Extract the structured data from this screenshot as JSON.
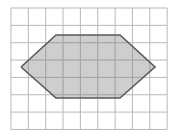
{
  "figure": {
    "background_color": "#ffffff",
    "canvas": {
      "width": 176,
      "height": 134
    }
  },
  "grid": {
    "name": "square-grid",
    "origin_x": 11,
    "origin_y": 8,
    "cell_size": 17.35,
    "columns": 9,
    "rows": 7,
    "line_color": "#b9b9b9",
    "line_width": 1,
    "overlay_line_color": "#a3a3a3"
  },
  "shape": {
    "name": "hexagon",
    "sides": 6,
    "fill_color": "#c6c6c6",
    "fill_opacity": 0.85,
    "stroke_color": "#5a5a5a",
    "stroke_width": 1.6,
    "points_px": "21,67 56,35 120,35 155,67 120,98 56,98",
    "vertices_px": [
      {
        "label": "left",
        "x": 21,
        "y": 67
      },
      {
        "label": "top-left",
        "x": 56,
        "y": 35
      },
      {
        "label": "top-right",
        "x": 120,
        "y": 35
      },
      {
        "label": "right",
        "x": 155,
        "y": 67
      },
      {
        "label": "bottom-right",
        "x": 120,
        "y": 98
      },
      {
        "label": "bottom-left",
        "x": 56,
        "y": 98
      }
    ],
    "vertices_grid": [
      {
        "label": "left",
        "col": 0.58,
        "row": 3.4
      },
      {
        "label": "top-left",
        "col": 2.59,
        "row": 1.56
      },
      {
        "label": "top-right",
        "col": 6.28,
        "row": 1.56
      },
      {
        "label": "right",
        "col": 8.3,
        "row": 3.4
      },
      {
        "label": "bottom-right",
        "col": 6.28,
        "row": 5.19
      },
      {
        "label": "bottom-left",
        "col": 2.59,
        "row": 5.19
      }
    ]
  }
}
